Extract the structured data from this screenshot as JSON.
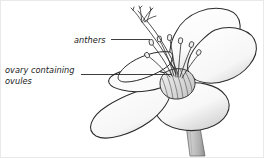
{
  "figure": {
    "background_color": "#ffffff",
    "outline_color": "#2b2b2b",
    "petal_fill": "#fdfdfd",
    "petal_shade": "#d9d9d9",
    "stem_color": "#b3b3b3",
    "text_color": "#1b1b1b"
  },
  "labels": {
    "anthers": "anthers",
    "ovary_line1": "ovary containing",
    "ovary_line2": "ovules"
  },
  "parts": {
    "anthers": "anthers",
    "filaments": "filaments",
    "style": "style",
    "stigma": "stigma",
    "ovary": "ovary",
    "petals": "petals",
    "stem": "stem"
  },
  "leaders": {
    "anthers_leader": "anthers-leader-line",
    "ovary_leader": "ovary-leader-line"
  }
}
